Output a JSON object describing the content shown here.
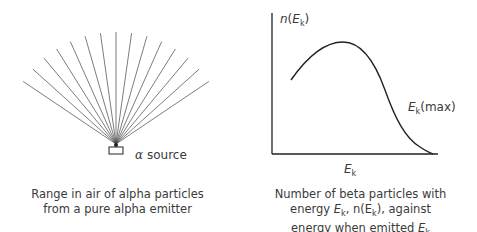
{
  "left_panel": {
    "source_label": "α source",
    "alpha_symbol": "α",
    "source_word": "source",
    "caption_line1": "Range in air of alpha particles",
    "caption_line2": "from a pure alpha emitter",
    "ray_count": 15
  },
  "right_panel": {
    "y_axis_label_n": "n",
    "y_axis_label_E": "E",
    "y_axis_label_k": "k",
    "x_axis_label_E": "E",
    "x_axis_label_k": "k",
    "emax_E": "E",
    "emax_k": "k",
    "emax_suffix": "(max)",
    "caption_line1": "Number of beta particles with",
    "caption_line2_pre": "energy ",
    "caption_line2_E": "E",
    "caption_line2_k": "k",
    "caption_line2_mid": ", n(E",
    "caption_line2_k2": "k",
    "caption_line2_post": "), against",
    "caption_line3_pre": "energy when emitted ",
    "caption_line3_E": "E",
    "caption_line3_k": "k"
  },
  "chart_data": {
    "type": "line",
    "title": "Number of beta particles with energy Ek, n(Ek), against energy when emitted Ek",
    "xlabel": "Ek",
    "ylabel": "n(Ek)",
    "annotations": [
      "Ek(max)"
    ],
    "grid": false,
    "series": [
      {
        "name": "beta energy spectrum",
        "x": [
          0.12,
          0.2,
          0.3,
          0.4,
          0.5,
          0.6,
          0.7,
          0.8,
          0.9,
          0.97
        ],
        "y": [
          0.53,
          0.68,
          0.78,
          0.79,
          0.72,
          0.55,
          0.33,
          0.15,
          0.05,
          0.0
        ]
      }
    ]
  }
}
